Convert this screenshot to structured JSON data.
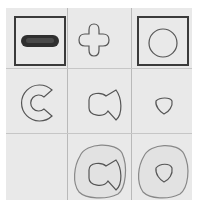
{
  "puzzle": {
    "type": "3x3 shape matrix",
    "cells": [
      {
        "row": 0,
        "col": 0,
        "shape": "pill-filled",
        "framed": true
      },
      {
        "row": 0,
        "col": 1,
        "shape": "cross-outline",
        "framed": false
      },
      {
        "row": 0,
        "col": 2,
        "shape": "circle-outline",
        "framed": true
      },
      {
        "row": 1,
        "col": 0,
        "shape": "c-shape-outline",
        "framed": false
      },
      {
        "row": 1,
        "col": 1,
        "shape": "bowtie-outline",
        "framed": false
      },
      {
        "row": 1,
        "col": 2,
        "shape": "rounded-triangle-outline",
        "framed": false
      },
      {
        "row": 2,
        "col": 0,
        "shape": "empty",
        "framed": false
      },
      {
        "row": 2,
        "col": 1,
        "shape": "bowtie-in-blob",
        "framed": false
      },
      {
        "row": 2,
        "col": 2,
        "shape": "triangle-in-blob",
        "framed": false
      }
    ],
    "colors": {
      "background": "#e9e9e9",
      "stroke": "#555555",
      "frame": "#3a3a3a",
      "fill": "#2f2f2f"
    }
  }
}
